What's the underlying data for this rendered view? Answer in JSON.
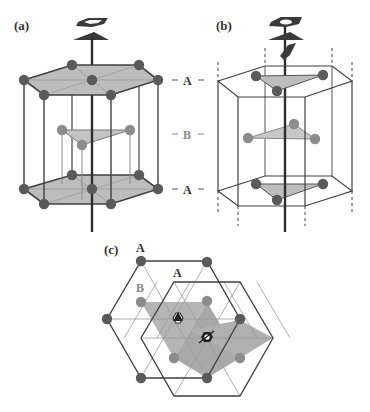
{
  "figure": {
    "panels": [
      {
        "id": "a",
        "label": "(a)",
        "description": "Hexagonal close-packed unit cell with 6-fold screw axis"
      },
      {
        "id": "b",
        "label": "(b)",
        "description": "Hexagonal prism cell showing ABA stacking with 3-fold axis"
      },
      {
        "id": "c",
        "label": "(c)",
        "description": "Top view projection of A and B layers"
      }
    ],
    "layer_labels": {
      "top": "A",
      "middle": "B",
      "bottom": "A"
    },
    "panel_c_labels": {
      "layer_a1": "A",
      "layer_a2": "A",
      "layer_b": "B"
    },
    "colors": {
      "atom_a": "#555555",
      "atom_b": "#8a8a8a",
      "plane_fill": "#b8b8b8",
      "line": "#404040",
      "label_a": "#333333",
      "label_b": "#888888"
    }
  }
}
